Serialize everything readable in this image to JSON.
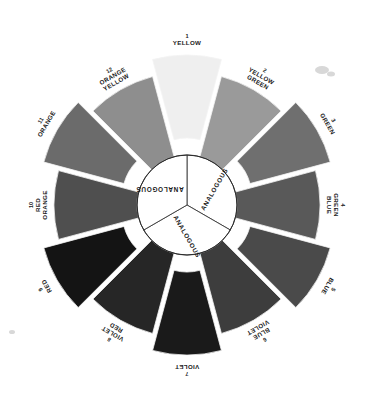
{
  "diagram": {
    "type": "color-wheel",
    "background_color": "#ffffff",
    "center": {
      "x": 187,
      "y": 205
    },
    "inner_radius": 50,
    "outer_radius": 133,
    "exploded_offset": 17,
    "segment_count": 12
  },
  "hub": {
    "wedge_count": 3,
    "labels": [
      "ANALOGOUS",
      "ANALOGOUS",
      "ANALOGOUS"
    ],
    "fill_color": "#ffffff",
    "stroke_color": "#3a3a3a",
    "wedge_rotations": [
      -60,
      60,
      180
    ]
  },
  "segments": [
    {
      "number": "1",
      "name": "YELLOW",
      "lines": [
        "YELLOW"
      ],
      "color": "#efefef",
      "exploded": true,
      "angle_start": -105,
      "angle_end": -75,
      "label_rotation": 0
    },
    {
      "number": "2",
      "name": "YELLOW GREEN",
      "lines": [
        "YELLOW",
        "GREEN"
      ],
      "color": "#9a9a9a",
      "exploded": false,
      "angle_start": -75,
      "angle_end": -45,
      "label_rotation": 30
    },
    {
      "number": "3",
      "name": "GREEN",
      "lines": [
        "GREEN"
      ],
      "color": "#6f6f6f",
      "exploded": true,
      "angle_start": -45,
      "angle_end": -15,
      "label_rotation": 60
    },
    {
      "number": "4",
      "name": "GREEN BLUE",
      "lines": [
        "GREEN",
        "BLUE"
      ],
      "color": "#595959",
      "exploded": false,
      "angle_start": -15,
      "angle_end": 15,
      "label_rotation": 90
    },
    {
      "number": "5",
      "name": "BLUE",
      "lines": [
        "BLUE"
      ],
      "color": "#4a4a4a",
      "exploded": true,
      "angle_start": 15,
      "angle_end": 45,
      "label_rotation": 120
    },
    {
      "number": "6",
      "name": "BLUE VIOLET",
      "lines": [
        "BLUE",
        "VIOLET"
      ],
      "color": "#3d3d3d",
      "exploded": false,
      "angle_start": 45,
      "angle_end": 75,
      "label_rotation": 150
    },
    {
      "number": "7",
      "name": "VIOLET",
      "lines": [
        "VIOLET"
      ],
      "color": "#1a1a1a",
      "exploded": true,
      "angle_start": 75,
      "angle_end": 105,
      "label_rotation": 180
    },
    {
      "number": "8",
      "name": "VIOLET RED",
      "lines": [
        "VIOLET",
        "RED"
      ],
      "color": "#262626",
      "exploded": false,
      "angle_start": 105,
      "angle_end": 135,
      "label_rotation": 210
    },
    {
      "number": "9",
      "name": "RED",
      "lines": [
        "RED"
      ],
      "color": "#141414",
      "exploded": true,
      "angle_start": 135,
      "angle_end": 165,
      "label_rotation": 240
    },
    {
      "number": "10",
      "name": "RED ORANGE",
      "lines": [
        "RED",
        "ORANGE"
      ],
      "color": "#4f4f4f",
      "exploded": false,
      "angle_start": 165,
      "angle_end": 195,
      "label_rotation": 270
    },
    {
      "number": "11",
      "name": "ORANGE",
      "lines": [
        "ORANGE"
      ],
      "color": "#6b6b6b",
      "exploded": true,
      "angle_start": 195,
      "angle_end": 225,
      "label_rotation": 300
    },
    {
      "number": "12",
      "name": "ORANGE YELLOW",
      "lines": [
        "ORANGE",
        "YELLOW"
      ],
      "color": "#8e8e8e",
      "exploded": false,
      "angle_start": 225,
      "angle_end": 255,
      "label_rotation": 330
    }
  ]
}
